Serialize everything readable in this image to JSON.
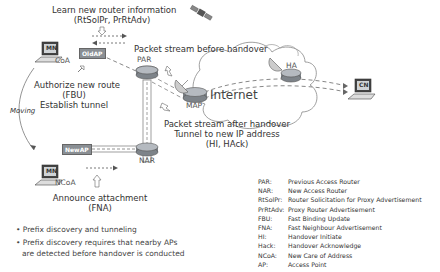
{
  "diagram": {
    "title_top": "Learn new router information",
    "title_top_sub": "(RtSolPr, PrRtAdv)",
    "authorize": [
      "Authorize new route",
      "(FBU)",
      "Establish tunnel"
    ],
    "moving": "Moving",
    "packet_before": "Packet stream before handover",
    "packet_after": [
      "Packet stream after handover",
      "Tunnel to new IP address",
      "(HI, HAck)"
    ],
    "internet": "Internet",
    "announce": [
      "Announce attachment",
      "(FNA)"
    ],
    "nodes": {
      "mn_old": "MN",
      "coa": "CoA",
      "old_ap": "OldAP",
      "par": "PAR",
      "map": "MAP",
      "ha": "HA",
      "cn": "CN",
      "nar": "NAR",
      "new_ap": "NewAP",
      "mn_new": "MN",
      "ncoa": "NCoA"
    }
  },
  "bullets": [
    "Prefix discovery and tunneling",
    "Prefix discovery requires that nearby APs",
    "are detected before handover is conducted"
  ],
  "legend": [
    {
      "abbr": "PAR:",
      "desc": "Previous Access Router"
    },
    {
      "abbr": "NAR:",
      "desc": "New Access Router"
    },
    {
      "abbr": "RtSolPr:",
      "desc": "Router Solicitation for Proxy Advertisement"
    },
    {
      "abbr": "PrRtAdv:",
      "desc": "Proxy Router Advertisement"
    },
    {
      "abbr": "FBU:",
      "desc": "Fast Binding Update"
    },
    {
      "abbr": "FNA:",
      "desc": "Fast Neighbour Advertisement"
    },
    {
      "abbr": "HI:",
      "desc": "Handover Initiate"
    },
    {
      "abbr": "Hack:",
      "desc": "Handover Acknowledge"
    },
    {
      "abbr": "NCoA:",
      "desc": "New Care of Address"
    },
    {
      "abbr": "AP:",
      "desc": "Access Point"
    }
  ]
}
